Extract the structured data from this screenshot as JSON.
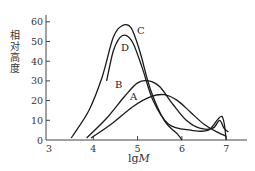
{
  "chart_data": {
    "type": "line",
    "title": "",
    "xlabel": "lgM",
    "ylabel": "相对高度",
    "xlim": [
      3,
      7.5
    ],
    "ylim": [
      0,
      65
    ],
    "xticks": [
      3,
      4,
      5,
      6,
      7
    ],
    "yticks": [
      0,
      10,
      20,
      30,
      40,
      50,
      60
    ],
    "grid": false,
    "legend": "inline curve labels",
    "series": [
      {
        "name": "A",
        "x": [
          3.95,
          4.4,
          4.9,
          5.3,
          5.6,
          5.9,
          6.2,
          6.5,
          6.8,
          7.0
        ],
        "y": [
          1,
          8,
          17,
          22,
          23,
          20,
          14,
          8,
          4,
          2
        ]
      },
      {
        "name": "B",
        "x": [
          3.85,
          4.3,
          4.7,
          5.0,
          5.25,
          5.5,
          5.8,
          6.1,
          6.4,
          6.7,
          6.85,
          6.95,
          7.05
        ],
        "y": [
          1,
          11,
          22,
          29,
          30,
          27,
          18,
          10,
          6,
          6,
          10,
          6,
          4
        ]
      },
      {
        "name": "C",
        "x": [
          3.5,
          3.9,
          4.2,
          4.45,
          4.65,
          4.85,
          5.05,
          5.3,
          5.6,
          5.9,
          6.0
        ],
        "y": [
          1,
          15,
          32,
          52,
          58,
          57,
          45,
          25,
          10,
          3,
          0
        ]
      },
      {
        "name": "D",
        "x": [
          4.3,
          4.45,
          4.6,
          4.75,
          4.9,
          5.1,
          5.35,
          5.7,
          6.2,
          6.6,
          6.9,
          7.0
        ],
        "y": [
          30,
          45,
          52,
          53,
          49,
          37,
          20,
          8,
          5,
          5,
          12,
          0
        ]
      }
    ],
    "annotations": [
      "A",
      "B",
      "C",
      "D"
    ]
  },
  "axes": {
    "xlabel_main": "lg",
    "xlabel_italic": "M",
    "ylabel": "相对高度",
    "xtick_labels": [
      "3",
      "4",
      "5",
      "6",
      "7"
    ],
    "ytick_labels": [
      "0",
      "10",
      "20",
      "30",
      "40",
      "50",
      "60"
    ]
  },
  "labels": {
    "A": "A",
    "B": "B",
    "C": "C",
    "D": "D"
  }
}
